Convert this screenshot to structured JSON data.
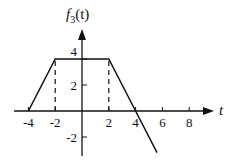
{
  "chart_data": {
    "type": "line",
    "title": "",
    "ylabel": "f3(t)",
    "ylabel_parts": {
      "main": "f",
      "sub": "3",
      "arg": "(t)"
    },
    "xlabel": "t",
    "x_ticks": [
      -4,
      -2,
      2,
      4,
      6,
      8
    ],
    "x_tick_labels": [
      "-4",
      "-2",
      "2",
      "4",
      "6",
      "8"
    ],
    "y_ticks": [
      4,
      2,
      -2
    ],
    "y_tick_labels": [
      "4",
      "2",
      "-2"
    ],
    "xlim": [
      -4.5,
      9.8
    ],
    "ylim": [
      -3.4,
      6.2
    ],
    "grid": false,
    "legend": null,
    "series": [
      {
        "name": "f3(t)",
        "x": [
          -4,
          -2,
          2,
          4,
          5.6
        ],
        "y": [
          0,
          4,
          4,
          0,
          -3.2
        ]
      }
    ],
    "guides": [
      {
        "type": "dashed-vertical",
        "x": -2,
        "from": 0,
        "to": 4
      },
      {
        "type": "dashed-vertical",
        "x": 2,
        "from": 0,
        "to": 4
      }
    ]
  }
}
